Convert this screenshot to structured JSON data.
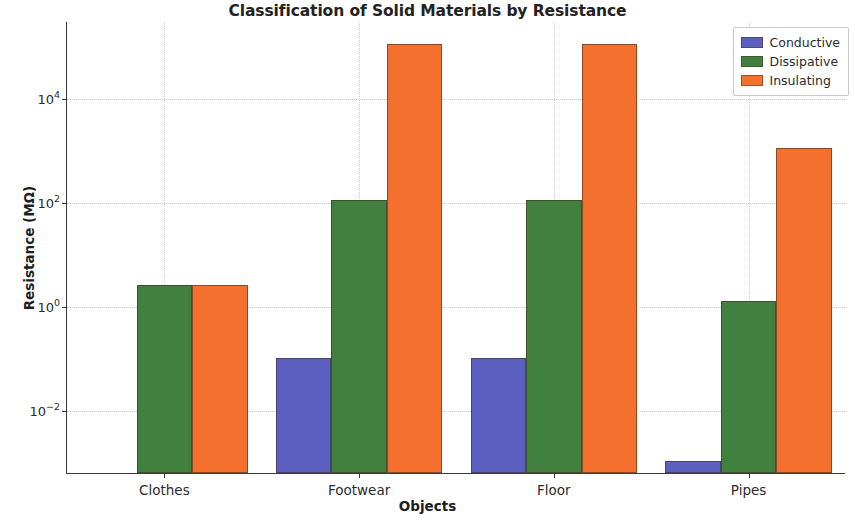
{
  "chart_data": {
    "type": "bar",
    "title": "Classification of Solid Materials by Resistance",
    "xlabel": "Objects",
    "ylabel": "Resistance (MΩ)",
    "yscale": "log",
    "ylim": [
      0.0006,
      300000
    ],
    "grid": true,
    "legend_position": "upper right",
    "categories": [
      "Clothes",
      "Footwear",
      "Floor",
      "Pipes"
    ],
    "ytick_labels": [
      "10⁻²",
      "10⁰",
      "10²",
      "10⁴"
    ],
    "ytick_values": [
      0.01,
      1,
      100,
      10000
    ],
    "ytick_mantissa": [
      "10",
      "10",
      "10",
      "10"
    ],
    "ytick_exponent": [
      "-2",
      "0",
      "2",
      "4"
    ],
    "series": [
      {
        "name": "Conductive",
        "color": "#5b5fc0",
        "values": [
          null,
          0.1,
          0.1,
          0.001
        ]
      },
      {
        "name": "Dissipative",
        "color": "#41803e",
        "values": [
          2.5,
          110,
          110,
          1.2
        ]
      },
      {
        "name": "Insulating",
        "color": "#f4702e",
        "values": [
          2.5,
          110000,
          110000,
          1100
        ]
      }
    ]
  }
}
